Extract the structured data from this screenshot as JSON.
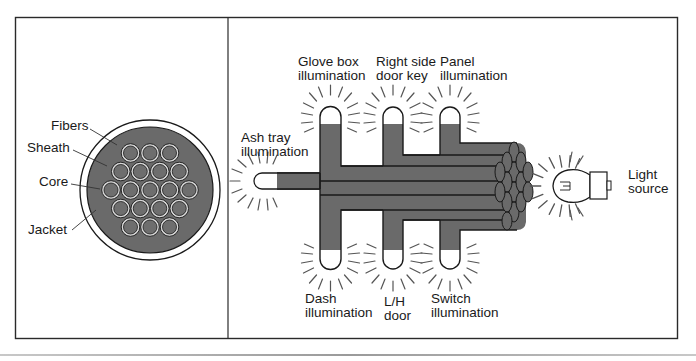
{
  "figure": {
    "left_panel": {
      "title": "Fiber optic cable cross-section",
      "labels": {
        "fibers": "Fibers",
        "sheath": "Sheath",
        "core": "Core",
        "jacket": "Jacket"
      },
      "fiber_rows": [
        3,
        4,
        5,
        4,
        3
      ]
    },
    "right_panel": {
      "title": "Fiber optic lighting distribution",
      "labels": {
        "glove_box": "Glove box\nillumination",
        "right_door_key": "Right side\ndoor key",
        "panel": "Panel\nillumination",
        "ash_tray": "Ash tray\nillumination",
        "light_source": "Light\nsource",
        "dash": "Dash\nillumination",
        "lh_door": "L/H\ndoor",
        "switch": "Switch\nillumination"
      }
    },
    "colors": {
      "fiber_fill": "#6e6e6e",
      "jacket_fill": "#6a6a6a",
      "line": "#1a1a1a",
      "background": "#ffffff"
    }
  }
}
